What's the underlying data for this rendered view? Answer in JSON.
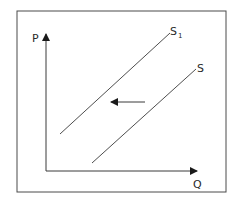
{
  "diagram": {
    "type": "supply-shift",
    "axes": {
      "y_label": "P",
      "x_label": "Q"
    },
    "curves": [
      {
        "id": "S1",
        "label": "S",
        "subscript": "1",
        "description": "shifted supply curve (left)"
      },
      {
        "id": "S",
        "label": "S",
        "subscript": "",
        "description": "original supply curve"
      }
    ],
    "shift_arrow": {
      "direction": "left",
      "from": "S",
      "to": "S1"
    },
    "colors": {
      "line": "#3a3a3a",
      "frame": "#4a4a4a",
      "background": "#ffffff",
      "text": "#2a2a2a"
    }
  }
}
